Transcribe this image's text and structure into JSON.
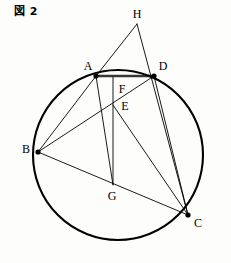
{
  "figure": {
    "caption": "図 2",
    "width": 231,
    "height": 263,
    "background_color": "#fdfdfb",
    "ink_color": "#000000"
  },
  "chart_data": {
    "type": "diagram",
    "subtype": "euclidean-circle-geometry",
    "title": "図 2",
    "xlabel": "",
    "ylabel": "",
    "xlim": [
      0,
      231
    ],
    "ylim": [
      263,
      0
    ],
    "grid": false,
    "legend": null,
    "circle": {
      "label": "circumcircle",
      "center_x": 118,
      "center_y": 155,
      "radius": 85,
      "stroke_width": 2.1
    },
    "points": [
      {
        "name": "A",
        "x": 96,
        "y": 76,
        "on_circle": true,
        "marker": true,
        "label_x": 88,
        "label_y": 66
      },
      {
        "name": "B",
        "x": 38,
        "y": 152,
        "on_circle": true,
        "marker": true,
        "label_x": 26,
        "label_y": 149
      },
      {
        "name": "C",
        "x": 188,
        "y": 215,
        "on_circle": true,
        "marker": true,
        "label_x": 198,
        "label_y": 223
      },
      {
        "name": "D",
        "x": 154,
        "y": 76,
        "on_circle": true,
        "marker": true,
        "label_x": 163,
        "label_y": 66
      },
      {
        "name": "E",
        "x": 113,
        "y": 105,
        "on_circle": false,
        "marker": false,
        "label_x": 125,
        "label_y": 106
      },
      {
        "name": "F",
        "x": 113,
        "y": 77,
        "on_circle": false,
        "marker": false,
        "label_x": 122,
        "label_y": 89
      },
      {
        "name": "G",
        "x": 113,
        "y": 185,
        "on_circle": false,
        "marker": false,
        "label_x": 112,
        "label_y": 196
      },
      {
        "name": "H",
        "x": 137,
        "y": 24,
        "on_circle": false,
        "marker": false,
        "label_x": 137,
        "label_y": 14
      }
    ],
    "segments": [
      {
        "name": "A-D",
        "from": "A",
        "to": "D",
        "style": "heavy-chord"
      },
      {
        "name": "H-A",
        "from": "H",
        "to": "A",
        "style": "thin"
      },
      {
        "name": "A-G",
        "from": "A",
        "to": "G",
        "style": "thin"
      },
      {
        "name": "H-C",
        "from": "H",
        "to": "C",
        "style": "thin"
      },
      {
        "name": "B-A",
        "from": "B",
        "to": "A",
        "style": "thin"
      },
      {
        "name": "B-D",
        "from": "B",
        "to": "D",
        "style": "thin"
      },
      {
        "name": "B-C",
        "from": "B",
        "to": "C",
        "style": "thin"
      },
      {
        "name": "D-C",
        "from": "D",
        "to": "C",
        "style": "thin"
      },
      {
        "name": "E-C",
        "from": "E",
        "to": "C",
        "style": "thin"
      },
      {
        "name": "F-G",
        "from": "F",
        "to": "G",
        "style": "vertical"
      }
    ]
  }
}
